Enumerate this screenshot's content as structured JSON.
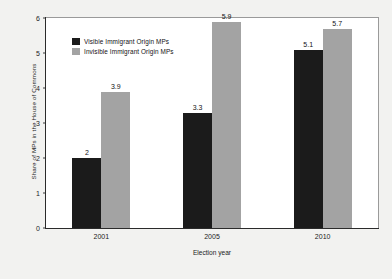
{
  "chart_data": {
    "type": "bar",
    "title": "",
    "subtitle": "",
    "xlabel": "Election year",
    "ylabel": "Share of MPs in the House of Commons",
    "categories": [
      "2001",
      "2005",
      "2010"
    ],
    "series": [
      {
        "name": "Visible Immigrant Origin MPs",
        "color": "#1b1b1b",
        "values": [
          2,
          3.3,
          5.1
        ],
        "labels": [
          "2",
          "3.3",
          "5.1"
        ]
      },
      {
        "name": "Invisible Immigrant Origin MPs",
        "color": "#a3a3a3",
        "values": [
          3.9,
          5.9,
          5.7
        ],
        "labels": [
          "3.9",
          "5.9",
          "5.7"
        ]
      }
    ],
    "ylim": [
      0,
      6
    ],
    "yticks": [
      0,
      1,
      2,
      3,
      4,
      5,
      6
    ],
    "ytick_labels": [
      "0",
      "1",
      "2",
      "3",
      "4",
      "5",
      "6"
    ],
    "grid": false,
    "legend_position": "upper-left-inside",
    "background_color": "#f2f2f0",
    "plot_background_color": "#ffffff"
  }
}
